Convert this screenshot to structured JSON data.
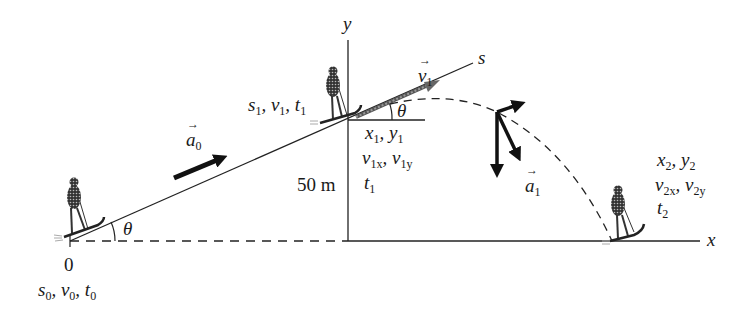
{
  "diagram": {
    "axes": {
      "x_label": "x",
      "y_label": "y",
      "s_label": "s"
    },
    "height_label": "50 m",
    "origin_label": "0",
    "angle_label": "θ",
    "points": {
      "start": {
        "s": "s",
        "v": "v",
        "t": "t",
        "sub": "0"
      },
      "top_slope": {
        "s": "s",
        "v": "v",
        "t": "t",
        "sub": "1"
      },
      "launch": {
        "xy": [
          "x",
          "y"
        ],
        "sub": "1",
        "vxy": [
          "v",
          "v"
        ],
        "vx_sub": "1x",
        "vy_sub": "1y",
        "t": "t",
        "t_sub": "1"
      },
      "landing": {
        "xy": [
          "x",
          "y"
        ],
        "sub": "2",
        "vxy": [
          "v",
          "v"
        ],
        "vx_sub": "2x",
        "vy_sub": "2y",
        "t": "t",
        "t_sub": "2"
      }
    },
    "vectors": {
      "a0": {
        "symbol": "a",
        "sub": "0"
      },
      "v1": {
        "symbol": "v",
        "sub": "1"
      },
      "a1": {
        "symbol": "a",
        "sub": "1"
      }
    },
    "colors": {
      "line": "#1a1a1a",
      "background": "#ffffff",
      "hatch": "#777777"
    }
  }
}
